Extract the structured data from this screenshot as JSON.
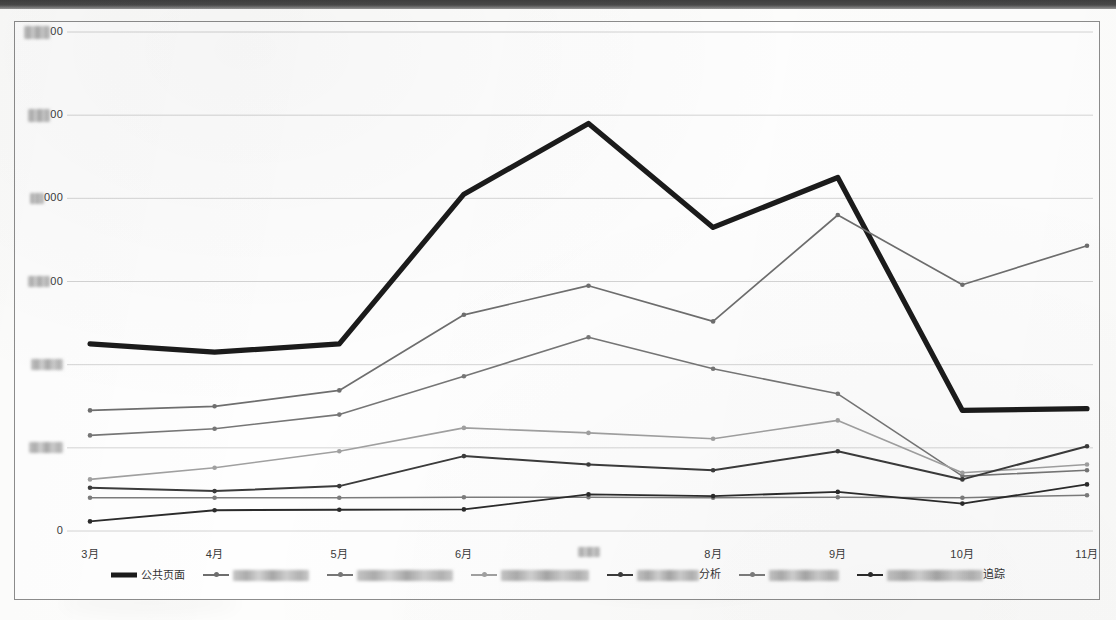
{
  "chart_data": {
    "type": "line",
    "title": "",
    "xlabel": "",
    "ylabel": "",
    "grid": true,
    "legend_position": "bottom",
    "ylim": [
      0,
      6000
    ],
    "ytick_values": [
      0,
      1000,
      2000,
      3000,
      4000,
      5000,
      6000
    ],
    "ytick_labels": [
      "0",
      "[redacted]",
      "[redacted]",
      "[redacted]00",
      "[redacted]000",
      "[redacted]00",
      "[redacted]00"
    ],
    "ytick_labels_visible_fragments": [
      "0",
      "",
      "",
      "00",
      "000",
      "00",
      "00"
    ],
    "categories": [
      "3月",
      "4月",
      "5月",
      "6月",
      "7月",
      "8月",
      "9月",
      "10月",
      "11月"
    ],
    "categories_visible": [
      "3月",
      "4月",
      "5月",
      "6月",
      "",
      "8月",
      "9月",
      "10月",
      "11月"
    ],
    "series": [
      {
        "name": "公共页面",
        "label_visible": "公共页面",
        "redacted": false,
        "color": "#1b1b1b",
        "width": 5.2,
        "marker": false,
        "values": [
          2250,
          2150,
          2250,
          4050,
          4900,
          3650,
          4250,
          1450,
          1470
        ]
      },
      {
        "name": "[redacted]",
        "label_visible": "",
        "redacted": true,
        "redact_width": 76,
        "color": "#6e6e6e",
        "width": 1.7,
        "marker": true,
        "values": [
          1450,
          1500,
          1690,
          2600,
          2950,
          2520,
          3800,
          2960,
          3430
        ]
      },
      {
        "name": "[redacted]",
        "label_visible": "",
        "redacted": true,
        "redact_width": 96,
        "color": "#767676",
        "width": 1.6,
        "marker": true,
        "values": [
          1150,
          1230,
          1400,
          1860,
          2330,
          1950,
          1650,
          660,
          730
        ]
      },
      {
        "name": "[redacted]",
        "label_visible": "",
        "redacted": true,
        "redact_width": 88,
        "color": "#a0a0a0",
        "width": 1.6,
        "marker": true,
        "values": [
          620,
          760,
          960,
          1240,
          1180,
          1110,
          1330,
          700,
          800
        ]
      },
      {
        "name": "[redacted]分析",
        "label_visible": "分析",
        "redacted": true,
        "redact_width": 62,
        "color": "#3b3b3b",
        "width": 2.0,
        "marker": true,
        "values": [
          520,
          480,
          540,
          900,
          800,
          730,
          960,
          620,
          1020
        ]
      },
      {
        "name": "[redacted]",
        "label_visible": "",
        "redacted": true,
        "redact_width": 70,
        "color": "#7c7c7c",
        "width": 1.5,
        "marker": true,
        "values": [
          400,
          400,
          400,
          405,
          405,
          400,
          405,
          400,
          430
        ]
      },
      {
        "name": "[redacted]追踪",
        "label_visible": "追踪",
        "redacted": true,
        "redact_width": 96,
        "color": "#2b2b2b",
        "width": 1.9,
        "marker": true,
        "values": [
          115,
          250,
          255,
          260,
          440,
          420,
          470,
          330,
          560
        ]
      }
    ]
  }
}
